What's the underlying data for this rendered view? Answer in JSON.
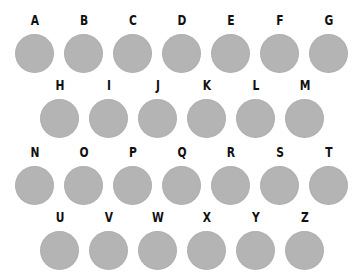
{
  "rows": [
    {
      "letters": [
        "A",
        "B",
        "C",
        "D",
        "E",
        "F",
        "G"
      ],
      "x0": 15,
      "y": 12
    },
    {
      "letters": [
        "H",
        "I",
        "J",
        "K",
        "L",
        "M"
      ],
      "x0": 40,
      "y": 77
    },
    {
      "letters": [
        "N",
        "O",
        "P",
        "Q",
        "R",
        "S",
        "T"
      ],
      "x0": 15,
      "y": 144
    },
    {
      "letters": [
        "U",
        "V",
        "W",
        "X",
        "Y",
        "Z"
      ],
      "x0": 40,
      "y": 209
    }
  ],
  "spacing": 49,
  "colors": {
    "dot": "#b4b4b4",
    "label": "#111111",
    "background": "#ffffff"
  }
}
